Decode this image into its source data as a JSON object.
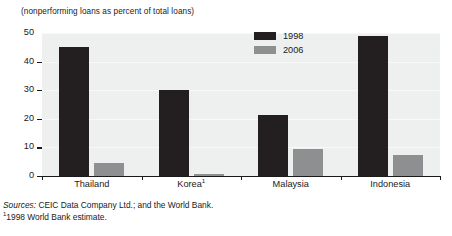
{
  "chart_data": {
    "type": "bar",
    "title": "",
    "subtitle": "(nonperforming loans as percent of total loans)",
    "xlabel": "",
    "ylabel": "",
    "ylim": [
      0,
      50
    ],
    "yticks": [
      0,
      10,
      20,
      30,
      40,
      50
    ],
    "grid": true,
    "legend_position": "top-center",
    "categories": [
      "Thailand",
      "Korea",
      "Malaysia",
      "Indonesia"
    ],
    "category_labels": [
      "Thailand",
      "Korea¹",
      "Malaysia",
      "Indonesia"
    ],
    "series": [
      {
        "name": "1998",
        "color": "#231f20",
        "values": [
          45,
          30,
          21.5,
          49
        ]
      },
      {
        "name": "2006",
        "color": "#8d8f90",
        "values": [
          4.5,
          0.8,
          9.5,
          7.5
        ]
      }
    ],
    "annotations": [
      "Sources: CEIC Data Company Ltd.; and the World Bank.",
      "¹1998 World Bank estimate."
    ]
  },
  "caption": {
    "units": "(nonperforming loans as percent of total loans)"
  },
  "legend": {
    "items": [
      {
        "label": "1998",
        "color": "#231f20"
      },
      {
        "label": "2006",
        "color": "#8d8f90"
      }
    ]
  },
  "axis": {
    "y_tick_labels": [
      "50",
      "40",
      "30",
      "20",
      "10",
      "0"
    ],
    "x_tick_labels": [
      "Thailand",
      "Korea",
      "Malaysia",
      "Indonesia"
    ],
    "korea_footnote_marker": "1"
  },
  "notes": {
    "sources_lead": "Sources:",
    "sources_text": " CEIC Data Company Ltd.; and the World Bank.",
    "footnote_marker": "1",
    "footnote_text": "1998 World Bank estimate."
  },
  "colors": {
    "series_1998": "#231f20",
    "series_2006": "#8d8f90",
    "plot_background": "#eef0f0",
    "axis": "#1a1a1a"
  }
}
